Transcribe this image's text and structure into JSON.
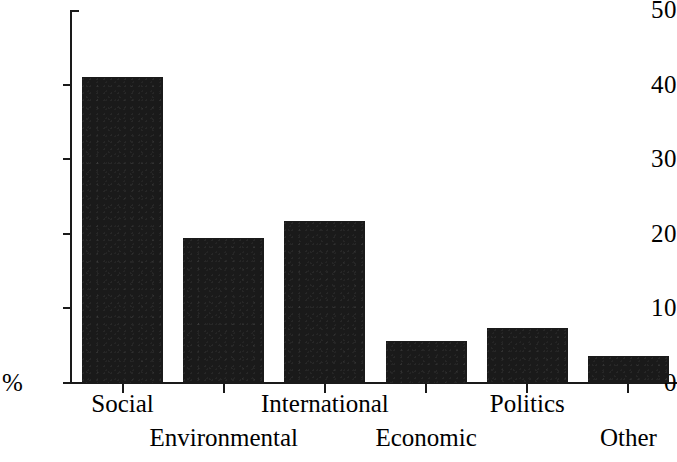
{
  "chart_data": {
    "type": "bar",
    "title": "",
    "subtitle": "",
    "xlabel": "",
    "ylabel": "%",
    "categories": [
      "Social",
      "Environmental",
      "International",
      "Economic",
      "Politics",
      "Other"
    ],
    "values": [
      41.0,
      19.4,
      21.7,
      5.6,
      7.4,
      3.6
    ],
    "ylim": [
      0,
      50
    ],
    "yticks": [
      0,
      10,
      20,
      30,
      40,
      50
    ],
    "ytick_labels": [
      "0",
      "10",
      "20",
      "30",
      "40",
      "50"
    ],
    "grid": false,
    "legend": false,
    "legend_position": "none",
    "bar_color": "#1a1a1a",
    "background_color": "#ffffff",
    "axis_color": "#1a1a1a",
    "label_rows": [
      0,
      1,
      0,
      1,
      0,
      1
    ],
    "annotations": []
  },
  "axis": {
    "percent_symbol": "%",
    "zero_label": "0"
  }
}
